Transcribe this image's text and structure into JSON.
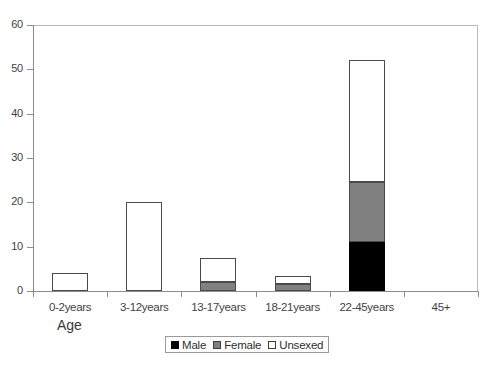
{
  "chart_data": {
    "type": "bar",
    "stacked": true,
    "title": "",
    "xlabel": "Age",
    "ylabel": "",
    "ylim": [
      0,
      60
    ],
    "ytick_values": [
      0,
      10,
      20,
      30,
      40,
      50,
      60
    ],
    "ytick_labels": [
      "0",
      "10",
      "20",
      "30",
      "40",
      "50",
      "60"
    ],
    "grid": false,
    "legend_position": "bottom-center",
    "categories": [
      "0-2years",
      "3-12years",
      "13-17years",
      "18-21years",
      "22-45years",
      "45+"
    ],
    "series": [
      {
        "name": "Male",
        "color": "#000000",
        "values": [
          0,
          0,
          0,
          0,
          11,
          0
        ]
      },
      {
        "name": "Female",
        "color": "#808080",
        "values": [
          0,
          0,
          2,
          1.5,
          13.5,
          0
        ]
      },
      {
        "name": "Unsexed",
        "color": "#ffffff",
        "values": [
          4,
          20,
          5.5,
          2,
          27.5,
          0
        ]
      }
    ],
    "totals": [
      4,
      20,
      7.5,
      3.5,
      52,
      0
    ]
  },
  "axis": {
    "x_title": "Age"
  },
  "legend": {
    "entries": [
      {
        "label": "Male",
        "swatch": "legend-swatch-male"
      },
      {
        "label": "Female",
        "swatch": "legend-swatch-female"
      },
      {
        "label": "Unsexed",
        "swatch": "legend-swatch-unsexed"
      }
    ]
  }
}
